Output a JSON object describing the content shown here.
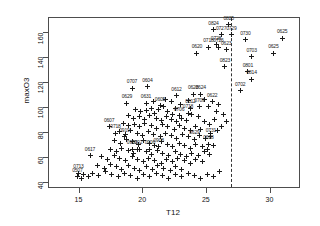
{
  "chart_data": {
    "type": "scatter",
    "title": "",
    "xlabel": "T12",
    "ylabel": "maxO3",
    "xlim": [
      12.6,
      32.4
    ],
    "ylim": [
      35,
      172
    ],
    "grid": false,
    "legend": null,
    "xticks": [
      15,
      20,
      25,
      30
    ],
    "yticks": [
      40,
      60,
      80,
      100,
      120,
      140,
      160
    ],
    "point_symbol": "plus",
    "annotations": [
      {
        "type": "vline",
        "x": 27.0,
        "style": "dashed",
        "color": "#333333"
      }
    ],
    "points": [
      {
        "label": "0825",
        "x": 26.8,
        "y": 166
      },
      {
        "label": "0824",
        "x": 25.6,
        "y": 162
      },
      {
        "label": "0727",
        "x": 26.2,
        "y": 158
      },
      {
        "label": "0729",
        "x": 27.0,
        "y": 158
      },
      {
        "label": "0730",
        "x": 28.1,
        "y": 154
      },
      {
        "label": "0625",
        "x": 31.0,
        "y": 155
      },
      {
        "label": "0728",
        "x": 25.8,
        "y": 150
      },
      {
        "label": "0726",
        "x": 26.0,
        "y": 148
      },
      {
        "label": "0718",
        "x": 25.2,
        "y": 148
      },
      {
        "label": "0623",
        "x": 26.6,
        "y": 146
      },
      {
        "label": "0703",
        "x": 28.6,
        "y": 140
      },
      {
        "label": "0625",
        "x": 30.3,
        "y": 143
      },
      {
        "label": "0620",
        "x": 24.3,
        "y": 143
      },
      {
        "label": "0823",
        "x": 26.5,
        "y": 132
      },
      {
        "label": "0801",
        "x": 28.3,
        "y": 128
      },
      {
        "label": "0814",
        "x": 28.6,
        "y": 122
      },
      {
        "label": "0702",
        "x": 27.7,
        "y": 113
      },
      {
        "label": "0707",
        "x": 19.2,
        "y": 115
      },
      {
        "label": "0604",
        "x": 20.4,
        "y": 116
      },
      {
        "label": "0612",
        "x": 22.7,
        "y": 109
      },
      {
        "label": "0628",
        "x": 24.0,
        "y": 110
      },
      {
        "label": "0624",
        "x": 24.6,
        "y": 110
      },
      {
        "label": "0622",
        "x": 25.5,
        "y": 104
      },
      {
        "label": "0629",
        "x": 18.8,
        "y": 103
      },
      {
        "label": "0631",
        "x": 20.3,
        "y": 103
      },
      {
        "label": "0605",
        "x": 21.4,
        "y": 101
      },
      {
        "label": "0709",
        "x": 24.5,
        "y": 100
      },
      {
        "label": "0612",
        "x": 23.8,
        "y": 99
      },
      {
        "label": "0706",
        "x": 22.9,
        "y": 93
      },
      {
        "label": "0718",
        "x": 23.6,
        "y": 95
      },
      {
        "label": "0607",
        "x": 17.4,
        "y": 84
      },
      {
        "label": "0718",
        "x": 17.9,
        "y": 79
      },
      {
        "label": "0919",
        "x": 18.6,
        "y": 76
      },
      {
        "label": "0629",
        "x": 24.1,
        "y": 74
      },
      {
        "label": "0731",
        "x": 25.4,
        "y": 76
      },
      {
        "label": "0628",
        "x": 25.2,
        "y": 70
      },
      {
        "label": "0617",
        "x": 15.9,
        "y": 61
      },
      {
        "label": "0713",
        "x": 15.0,
        "y": 47
      },
      {
        "label": "0507",
        "x": 14.9,
        "y": 44
      },
      {
        "label": "0906",
        "x": 20.6,
        "y": 66
      },
      {
        "label": "0908",
        "x": 21.3,
        "y": 68
      },
      {
        "label": "0902",
        "x": 19.6,
        "y": 66
      },
      {
        "label": "0903",
        "x": 19.2,
        "y": 66
      }
    ],
    "cluster_points": [
      {
        "x": 19.5,
        "y": 98
      },
      {
        "x": 19.9,
        "y": 96
      },
      {
        "x": 20.3,
        "y": 97
      },
      {
        "x": 20.7,
        "y": 99
      },
      {
        "x": 21.0,
        "y": 95
      },
      {
        "x": 21.3,
        "y": 98
      },
      {
        "x": 21.7,
        "y": 100
      },
      {
        "x": 22.0,
        "y": 96
      },
      {
        "x": 22.4,
        "y": 94
      },
      {
        "x": 18.9,
        "y": 93
      },
      {
        "x": 19.3,
        "y": 91
      },
      {
        "x": 19.8,
        "y": 92
      },
      {
        "x": 20.2,
        "y": 90
      },
      {
        "x": 20.6,
        "y": 93
      },
      {
        "x": 21.1,
        "y": 91
      },
      {
        "x": 21.5,
        "y": 89
      },
      {
        "x": 21.9,
        "y": 92
      },
      {
        "x": 22.3,
        "y": 90
      },
      {
        "x": 22.7,
        "y": 88
      },
      {
        "x": 23.1,
        "y": 91
      },
      {
        "x": 23.5,
        "y": 89
      },
      {
        "x": 18.5,
        "y": 87
      },
      {
        "x": 18.9,
        "y": 85
      },
      {
        "x": 19.4,
        "y": 86
      },
      {
        "x": 19.8,
        "y": 84
      },
      {
        "x": 20.2,
        "y": 87
      },
      {
        "x": 20.7,
        "y": 85
      },
      {
        "x": 21.1,
        "y": 83
      },
      {
        "x": 21.6,
        "y": 86
      },
      {
        "x": 22.0,
        "y": 84
      },
      {
        "x": 22.5,
        "y": 82
      },
      {
        "x": 22.9,
        "y": 85
      },
      {
        "x": 23.3,
        "y": 83
      },
      {
        "x": 23.8,
        "y": 81
      },
      {
        "x": 24.2,
        "y": 84
      },
      {
        "x": 24.6,
        "y": 82
      },
      {
        "x": 18.2,
        "y": 80
      },
      {
        "x": 18.7,
        "y": 78
      },
      {
        "x": 19.1,
        "y": 81
      },
      {
        "x": 19.6,
        "y": 79
      },
      {
        "x": 20.0,
        "y": 77
      },
      {
        "x": 20.5,
        "y": 80
      },
      {
        "x": 20.9,
        "y": 78
      },
      {
        "x": 21.4,
        "y": 76
      },
      {
        "x": 21.8,
        "y": 79
      },
      {
        "x": 22.3,
        "y": 77
      },
      {
        "x": 22.7,
        "y": 75
      },
      {
        "x": 23.2,
        "y": 78
      },
      {
        "x": 23.6,
        "y": 76
      },
      {
        "x": 24.1,
        "y": 74
      },
      {
        "x": 24.5,
        "y": 77
      },
      {
        "x": 25.0,
        "y": 75
      },
      {
        "x": 25.4,
        "y": 79
      },
      {
        "x": 25.9,
        "y": 81
      },
      {
        "x": 17.8,
        "y": 73
      },
      {
        "x": 18.3,
        "y": 71
      },
      {
        "x": 18.8,
        "y": 74
      },
      {
        "x": 19.2,
        "y": 72
      },
      {
        "x": 19.7,
        "y": 70
      },
      {
        "x": 20.1,
        "y": 73
      },
      {
        "x": 20.6,
        "y": 71
      },
      {
        "x": 21.0,
        "y": 69
      },
      {
        "x": 21.5,
        "y": 72
      },
      {
        "x": 22.0,
        "y": 70
      },
      {
        "x": 22.4,
        "y": 68
      },
      {
        "x": 22.9,
        "y": 71
      },
      {
        "x": 23.3,
        "y": 69
      },
      {
        "x": 23.8,
        "y": 67
      },
      {
        "x": 24.2,
        "y": 70
      },
      {
        "x": 24.7,
        "y": 68
      },
      {
        "x": 25.1,
        "y": 66
      },
      {
        "x": 25.6,
        "y": 69
      },
      {
        "x": 17.5,
        "y": 66
      },
      {
        "x": 18.0,
        "y": 64
      },
      {
        "x": 18.4,
        "y": 67
      },
      {
        "x": 18.9,
        "y": 65
      },
      {
        "x": 19.3,
        "y": 63
      },
      {
        "x": 19.8,
        "y": 66
      },
      {
        "x": 20.3,
        "y": 64
      },
      {
        "x": 20.7,
        "y": 62
      },
      {
        "x": 21.2,
        "y": 65
      },
      {
        "x": 21.6,
        "y": 63
      },
      {
        "x": 22.1,
        "y": 61
      },
      {
        "x": 22.6,
        "y": 64
      },
      {
        "x": 23.0,
        "y": 62
      },
      {
        "x": 23.5,
        "y": 60
      },
      {
        "x": 23.9,
        "y": 63
      },
      {
        "x": 24.4,
        "y": 61
      },
      {
        "x": 24.9,
        "y": 64
      },
      {
        "x": 25.3,
        "y": 62
      },
      {
        "x": 16.8,
        "y": 60
      },
      {
        "x": 17.3,
        "y": 58
      },
      {
        "x": 17.8,
        "y": 61
      },
      {
        "x": 18.2,
        "y": 59
      },
      {
        "x": 18.7,
        "y": 57
      },
      {
        "x": 19.2,
        "y": 60
      },
      {
        "x": 19.6,
        "y": 58
      },
      {
        "x": 20.1,
        "y": 56
      },
      {
        "x": 20.5,
        "y": 59
      },
      {
        "x": 21.0,
        "y": 57
      },
      {
        "x": 21.5,
        "y": 55
      },
      {
        "x": 21.9,
        "y": 58
      },
      {
        "x": 22.4,
        "y": 56
      },
      {
        "x": 22.8,
        "y": 59
      },
      {
        "x": 23.3,
        "y": 57
      },
      {
        "x": 23.8,
        "y": 55
      },
      {
        "x": 24.2,
        "y": 58
      },
      {
        "x": 24.7,
        "y": 56
      },
      {
        "x": 16.5,
        "y": 53
      },
      {
        "x": 17.0,
        "y": 51
      },
      {
        "x": 17.5,
        "y": 54
      },
      {
        "x": 18.0,
        "y": 52
      },
      {
        "x": 18.4,
        "y": 50
      },
      {
        "x": 18.9,
        "y": 53
      },
      {
        "x": 19.4,
        "y": 51
      },
      {
        "x": 19.8,
        "y": 49
      },
      {
        "x": 20.3,
        "y": 52
      },
      {
        "x": 20.8,
        "y": 50
      },
      {
        "x": 21.2,
        "y": 53
      },
      {
        "x": 21.7,
        "y": 51
      },
      {
        "x": 22.2,
        "y": 49
      },
      {
        "x": 22.6,
        "y": 52
      },
      {
        "x": 23.1,
        "y": 50
      },
      {
        "x": 16.1,
        "y": 47
      },
      {
        "x": 16.6,
        "y": 45
      },
      {
        "x": 17.1,
        "y": 48
      },
      {
        "x": 17.6,
        "y": 46
      },
      {
        "x": 18.1,
        "y": 44
      },
      {
        "x": 18.6,
        "y": 47
      },
      {
        "x": 19.1,
        "y": 45
      },
      {
        "x": 19.6,
        "y": 43
      },
      {
        "x": 20.1,
        "y": 46
      },
      {
        "x": 20.6,
        "y": 44
      },
      {
        "x": 21.1,
        "y": 47
      },
      {
        "x": 21.6,
        "y": 45
      },
      {
        "x": 22.1,
        "y": 43
      },
      {
        "x": 22.6,
        "y": 46
      },
      {
        "x": 23.1,
        "y": 44
      },
      {
        "x": 23.6,
        "y": 47
      },
      {
        "x": 24.1,
        "y": 45
      },
      {
        "x": 24.6,
        "y": 43
      },
      {
        "x": 25.1,
        "y": 46
      },
      {
        "x": 25.6,
        "y": 44
      },
      {
        "x": 26.1,
        "y": 48
      },
      {
        "x": 24.9,
        "y": 88
      },
      {
        "x": 25.3,
        "y": 86
      },
      {
        "x": 25.7,
        "y": 90
      },
      {
        "x": 26.2,
        "y": 84
      },
      {
        "x": 26.6,
        "y": 88
      },
      {
        "x": 24.4,
        "y": 92
      },
      {
        "x": 23.9,
        "y": 94
      },
      {
        "x": 26.4,
        "y": 94
      },
      {
        "x": 25.8,
        "y": 96
      },
      {
        "x": 15.4,
        "y": 46
      },
      {
        "x": 15.8,
        "y": 44
      },
      {
        "x": 15.2,
        "y": 43
      },
      {
        "x": 22.3,
        "y": 104
      },
      {
        "x": 23.0,
        "y": 102
      },
      {
        "x": 23.6,
        "y": 105
      },
      {
        "x": 24.9,
        "y": 106
      },
      {
        "x": 25.2,
        "y": 100
      },
      {
        "x": 26.0,
        "y": 102
      },
      {
        "x": 21.8,
        "y": 106
      },
      {
        "x": 22.6,
        "y": 99
      },
      {
        "x": 20.9,
        "y": 104
      }
    ]
  }
}
